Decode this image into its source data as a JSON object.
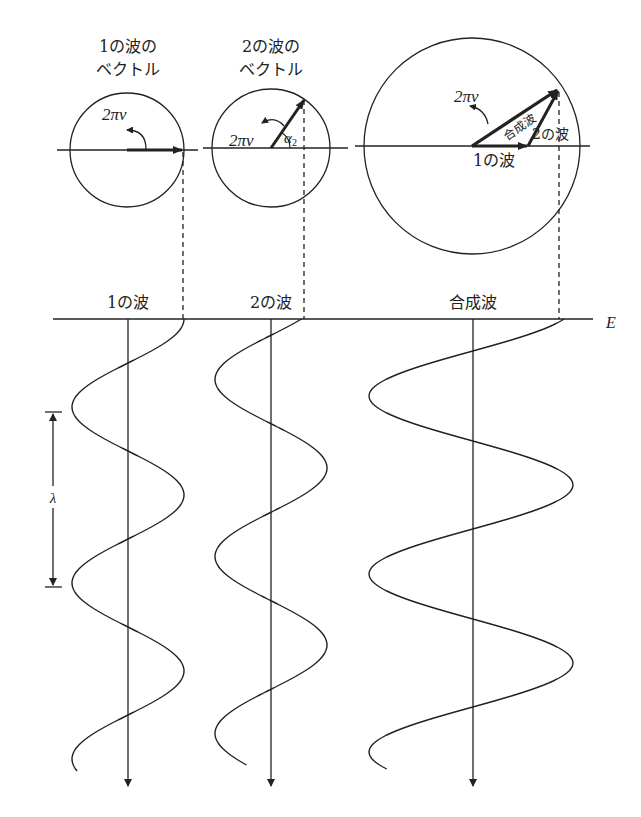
{
  "labels": {
    "vector1_title_line1": "1の波の",
    "vector1_title_line2": "ベクトル",
    "vector2_title_line1": "2の波の",
    "vector2_title_line2": "ベクトル",
    "rotation_label": "2πν",
    "alpha_label": "α",
    "alpha_subscript": "2",
    "sum_vector1_label": "1の波",
    "sum_vector2_label": "2の波",
    "sum_resultant_label": "合成波",
    "wave1_label": "1の波",
    "wave2_label": "2の波",
    "resultant_wave_label": "合成波",
    "field_axis_label": "E",
    "wavelength_label": "λ"
  },
  "colors": {
    "line": "#222222",
    "background": "#ffffff"
  }
}
